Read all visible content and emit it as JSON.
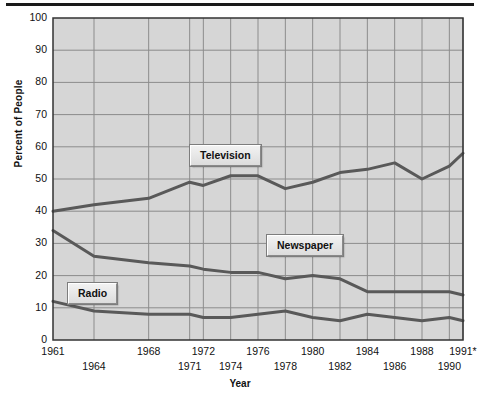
{
  "chart_data": {
    "type": "line",
    "title": "",
    "xlabel": "Year",
    "ylabel": "Percent of People",
    "ylim": [
      0,
      100
    ],
    "ytick_labels": [
      "0",
      "10",
      "20",
      "30",
      "40",
      "50",
      "60",
      "70",
      "80",
      "90",
      "100"
    ],
    "ytick_values": [
      0,
      10,
      20,
      30,
      40,
      50,
      60,
      70,
      80,
      90,
      100
    ],
    "xlim": [
      1961,
      1991
    ],
    "xtick_labels_row1": [
      "1961",
      "1968",
      "1972",
      "1976",
      "1980",
      "1984",
      "1988",
      "1991*"
    ],
    "xtick_values_row1": [
      1961,
      1968,
      1972,
      1976,
      1980,
      1984,
      1988,
      1991
    ],
    "xtick_labels_row2": [
      "1964",
      "1971",
      "1974",
      "1978",
      "1982",
      "1986",
      "1990"
    ],
    "xtick_values_row2": [
      1964,
      1971,
      1974,
      1978,
      1982,
      1986,
      1990
    ],
    "grid": true,
    "legend_position": "inline-labels",
    "x": [
      1961,
      1964,
      1968,
      1971,
      1972,
      1974,
      1976,
      1978,
      1980,
      1982,
      1984,
      1986,
      1988,
      1990,
      1991
    ],
    "series": [
      {
        "name": "Television",
        "color": "#595959",
        "values": [
          40,
          42,
          44,
          49,
          48,
          51,
          51,
          47,
          49,
          52,
          53,
          55,
          50,
          54,
          58
        ]
      },
      {
        "name": "Newspaper",
        "color": "#595959",
        "values": [
          34,
          26,
          24,
          23,
          22,
          21,
          21,
          19,
          20,
          19,
          15,
          15,
          15,
          15,
          14
        ]
      },
      {
        "name": "Radio",
        "color": "#595959",
        "values": [
          12,
          9,
          8,
          8,
          7,
          7,
          8,
          9,
          7,
          6,
          8,
          7,
          6,
          7,
          6
        ]
      }
    ],
    "plot_background": "#d6d6d6",
    "grid_color": "#8c8c8c",
    "axis_color": "#333333"
  },
  "labels": {
    "television": "Television",
    "newspaper": "Newspaper",
    "radio": "Radio"
  }
}
